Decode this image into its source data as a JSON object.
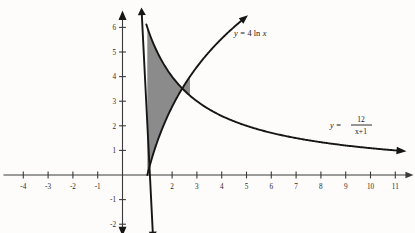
{
  "chart_data": {
    "type": "line",
    "title": "",
    "xlabel": "x",
    "ylabel": "y",
    "xlim": [
      -4.8,
      11.8
    ],
    "ylim": [
      -2.4,
      6.6
    ],
    "grid": false,
    "legend_position": "inline-annotations",
    "x_ticks": [
      -4,
      -3,
      -2,
      -1,
      2,
      3,
      4,
      5,
      6,
      7,
      8,
      9,
      10,
      11
    ],
    "x_tick_labels": [
      "-4",
      "-3",
      "-2",
      "-1",
      "2",
      "3",
      "4",
      "5",
      "6",
      "7",
      "8",
      "9",
      "10",
      "11"
    ],
    "y_ticks": [
      -2,
      -1,
      1,
      2,
      3,
      4,
      5,
      6
    ],
    "y_tick_labels": [
      "-2",
      "-1",
      "1",
      "2",
      "3",
      "4",
      "5",
      "6"
    ],
    "series": [
      {
        "name": "y = 4 ln x",
        "equation": "y = 4 ln x",
        "color": "#161616",
        "arrow_end": true,
        "x": [
          1.0,
          1.2,
          1.5,
          1.8,
          2.1,
          2.4,
          2.7,
          3.0,
          3.4,
          3.8,
          4.2,
          4.6,
          5.0
        ],
        "values": [
          0.0,
          0.73,
          1.62,
          2.35,
          2.97,
          3.5,
          3.97,
          4.39,
          4.89,
          5.34,
          5.73,
          6.1,
          6.44
        ]
      },
      {
        "name": "y = 12/(x+1)",
        "equation": "y = 12/(x+1)",
        "color": "#161616",
        "arrow_end": true,
        "x": [
          1.0,
          1.5,
          2.0,
          2.5,
          3.0,
          4.0,
          5.0,
          6.0,
          7.0,
          8.0,
          9.0,
          10.0,
          11.0
        ],
        "values": [
          6.0,
          4.8,
          4.0,
          3.43,
          3.0,
          2.4,
          2.0,
          1.71,
          1.5,
          1.33,
          1.2,
          1.09,
          1.0
        ]
      },
      {
        "name": "x = 1 boundary line",
        "equation": "x = 1",
        "color": "#161616",
        "arrow_both": true,
        "x": [
          0.78,
          1.22
        ],
        "values": [
          6.5,
          -2.3
        ]
      }
    ],
    "shaded_region": {
      "label": "area between y = 4 ln x and y = 12/(x+1) from x = 1 to intersection",
      "fill_color": "#8b8b8b",
      "x_from": 1.0,
      "x_to": 2.72,
      "upper_curve": "y = 12/(x+1)",
      "lower_curve": "y = 4 ln x"
    },
    "intersection_point": {
      "x": 2.72,
      "y": 3.99
    },
    "annotations": [
      {
        "text": "y = 4 ln x",
        "x": 5.2,
        "y": 5.8
      },
      {
        "text": "y = 12/(x+1)",
        "x": 10.3,
        "y": 2.3
      }
    ]
  },
  "labels": {
    "eq1": {
      "lhs": "y",
      "eq": "=",
      "coef": "4",
      "fn": "ln",
      "var": "x"
    },
    "eq2": {
      "lhs": "y",
      "eq": "=",
      "num": "12",
      "den": "x+1"
    }
  },
  "colors": {
    "background": "#fdfcfa",
    "axis": "#3a3a3a",
    "curve": "#161616",
    "shading": "#8b8b8b",
    "text": "#1a1a1a"
  }
}
